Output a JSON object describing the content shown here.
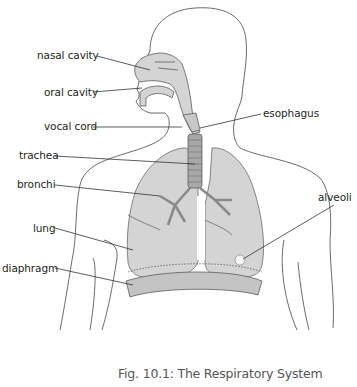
{
  "figure": {
    "caption": "Fig. 10.1: The Respiratory System",
    "colors": {
      "outline": "#5a5a5a",
      "organ_fill": "#d4d4d4",
      "organ_dark": "#9a9a9a",
      "label_text": "#231f20",
      "caption_text": "#555555"
    }
  },
  "labels": {
    "nasal_cavity": "nasal cavity",
    "oral_cavity": "oral cavity",
    "vocal_cord": "vocal cord",
    "esophagus": "esophagus",
    "trachea": "trachea",
    "bronchi": "bronchi",
    "lung": "lung",
    "diaphragm": "diaphragm",
    "alveoli": "alveoli"
  }
}
